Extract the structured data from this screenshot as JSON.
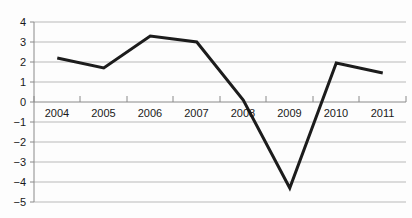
{
  "chart_data": {
    "type": "line",
    "title": "",
    "subtitle": "",
    "xlabel": "",
    "ylabel": "",
    "categories": [
      "2004",
      "2005",
      "2006",
      "2007",
      "2008",
      "2009",
      "2010",
      "2011"
    ],
    "values": [
      2.2,
      1.7,
      3.3,
      3.0,
      0.1,
      -4.3,
      1.95,
      1.45
    ],
    "series": [
      {
        "name": "",
        "values": [
          2.2,
          1.7,
          3.3,
          3.0,
          0.1,
          -4.3,
          1.95,
          1.45
        ]
      }
    ],
    "ylim": [
      -5,
      4
    ],
    "yticks": [
      4,
      3,
      2,
      1,
      0,
      -1,
      -2,
      -3,
      -4,
      -5
    ],
    "ytick_labels": [
      "4",
      "3",
      "2",
      "1",
      "0",
      "−1",
      "−2",
      "−3",
      "−4",
      "−5"
    ],
    "xtick_labels": [
      "2004",
      "2005",
      "2006",
      "2007",
      "2008",
      "2009",
      "2010",
      "2011"
    ],
    "grid": true,
    "grid_axis": "y",
    "legend": "none",
    "annotations": [],
    "colors": {
      "line": "#1c1c1c",
      "grid": "#b9b9b9",
      "axis": "#8a8a8a",
      "text": "#1a1a1a",
      "background": "#fdfdfd"
    }
  }
}
